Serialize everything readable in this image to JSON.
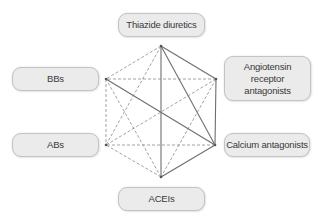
{
  "diagram": {
    "type": "hexagon-relationship",
    "nodes": [
      {
        "id": "thiazide",
        "label": "Thiazide diuretics",
        "x": 118,
        "y": 13,
        "w": 87,
        "h": 24,
        "vx": 161,
        "vy": 46
      },
      {
        "id": "arb",
        "label": "Angiotensin\nreceptor\nantagonists",
        "x": 224,
        "y": 56,
        "w": 87,
        "h": 45,
        "vx": 216,
        "vy": 79
      },
      {
        "id": "calcium",
        "label": "Calcium antagonists",
        "x": 224,
        "y": 133,
        "w": 86,
        "h": 24,
        "vx": 215,
        "vy": 145
      },
      {
        "id": "acei",
        "label": "ACEIs",
        "x": 118,
        "y": 187,
        "w": 87,
        "h": 24,
        "vx": 161,
        "vy": 177
      },
      {
        "id": "ab",
        "label": "ABs",
        "x": 12,
        "y": 133,
        "w": 87,
        "h": 24,
        "vx": 106,
        "vy": 145
      },
      {
        "id": "bb",
        "label": "BBs",
        "x": 12,
        "y": 67,
        "w": 87,
        "h": 24,
        "vx": 106,
        "vy": 79
      }
    ],
    "edges": [
      {
        "from": "thiazide",
        "to": "arb",
        "style": "solid"
      },
      {
        "from": "thiazide",
        "to": "calcium",
        "style": "solid"
      },
      {
        "from": "thiazide",
        "to": "acei",
        "style": "solid"
      },
      {
        "from": "thiazide",
        "to": "bb",
        "style": "dashed"
      },
      {
        "from": "thiazide",
        "to": "ab",
        "style": "dashed"
      },
      {
        "from": "arb",
        "to": "calcium",
        "style": "solid"
      },
      {
        "from": "arb",
        "to": "bb",
        "style": "dashed"
      },
      {
        "from": "arb",
        "to": "ab",
        "style": "dashed"
      },
      {
        "from": "arb",
        "to": "acei",
        "style": "dashed"
      },
      {
        "from": "calcium",
        "to": "acei",
        "style": "solid"
      },
      {
        "from": "calcium",
        "to": "bb",
        "style": "solid"
      },
      {
        "from": "calcium",
        "to": "ab",
        "style": "dashed"
      },
      {
        "from": "acei",
        "to": "bb",
        "style": "dashed"
      },
      {
        "from": "acei",
        "to": "ab",
        "style": "dashed"
      },
      {
        "from": "bb",
        "to": "ab",
        "style": "dashed"
      }
    ],
    "colors": {
      "solid_line": "#6e6e6e",
      "dashed_line": "#8a8a8a",
      "node_fill": "#ebebeb",
      "node_border": "#c4c4c4",
      "text": "#3a3a3a"
    }
  }
}
